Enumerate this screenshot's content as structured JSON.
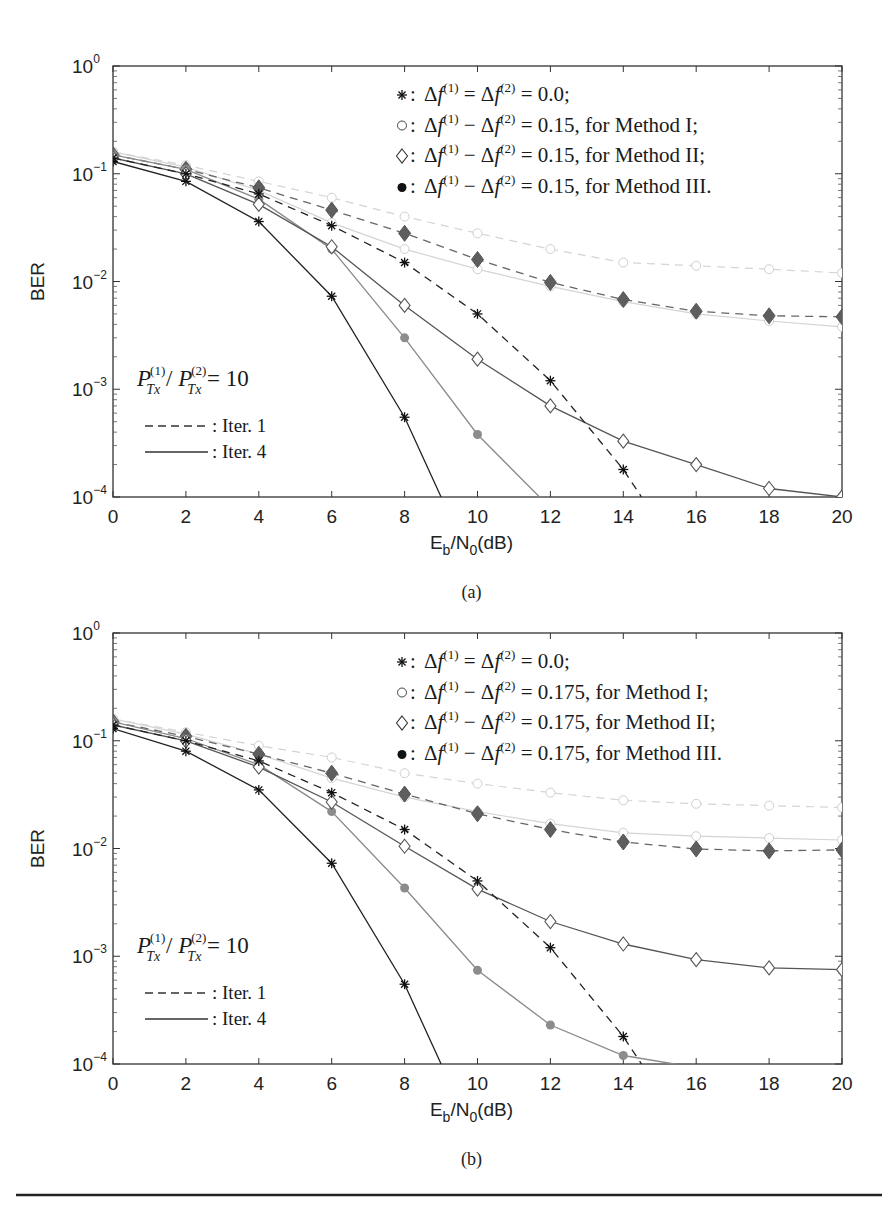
{
  "figure": {
    "rule_color": "#222222",
    "colors": {
      "star": "#222222",
      "diamond": "#555555",
      "filled_iter4": "#8a8a8a",
      "filled_iter1": "#666666",
      "circle": "#d4d4d4"
    }
  },
  "chart_data": [
    {
      "id": "a",
      "type": "line",
      "caption": "(a)",
      "title": "",
      "xlabel": "Eb/N0(dB)",
      "xlabel_parts": {
        "E": "E",
        "sub_b": "b",
        "slash": "/N",
        "sub_0": "0",
        "unit": "(dB)"
      },
      "ylabel": "BER",
      "xscale": "linear",
      "yscale": "log",
      "xlim": [
        0,
        20
      ],
      "ylim": [
        0.0001,
        1
      ],
      "x_ticks": [
        "0",
        "2",
        "4",
        "6",
        "8",
        "10",
        "12",
        "14",
        "16",
        "18",
        "20"
      ],
      "y_ticks": [
        {
          "base": "10",
          "exp": "0"
        },
        {
          "base": "10",
          "exp": "−1"
        },
        {
          "base": "10",
          "exp": "−2"
        },
        {
          "base": "10",
          "exp": "−3"
        },
        {
          "base": "10",
          "exp": "−4"
        }
      ],
      "grid": false,
      "legend": {
        "position": "upper right",
        "entries": [
          {
            "marker": "*",
            "text": "Δf(1) = Δf(2) = 0.0;"
          },
          {
            "marker": "○",
            "text": "Δf(1) − Δf(2) = 0.15, for Method I;"
          },
          {
            "marker": "◇",
            "text": "Δf(1) − Δf(2) = 0.15, for Method II;"
          },
          {
            "marker": "●",
            "text": "Δf(1) − Δf(2) = 0.15, for Method III."
          }
        ]
      },
      "annotation": {
        "text": "P_Tx^(1) / P_Tx^(2) = 10",
        "ratio_value": "10"
      },
      "line_legend": [
        {
          "style": "dashed",
          "text": ": Iter. 1"
        },
        {
          "style": "solid",
          "text": ": Iter. 4"
        }
      ],
      "series": [
        {
          "name": "Δf=0, Iter. 1",
          "marker": "star",
          "style": "dashed",
          "x": [
            0,
            2,
            4,
            6,
            8,
            10,
            12,
            14,
            14.5
          ],
          "values": [
            0.14,
            0.1,
            0.065,
            0.033,
            0.015,
            0.005,
            0.0012,
            0.00018,
            0.0001
          ],
          "marked": 8
        },
        {
          "name": "Δf=0, Iter. 4",
          "marker": "star",
          "style": "solid",
          "x": [
            0,
            2,
            4,
            6,
            8,
            9
          ],
          "values": [
            0.13,
            0.085,
            0.036,
            0.0073,
            0.00055,
            0.0001
          ],
          "marked": 5
        },
        {
          "name": "Method I, Iter. 1",
          "marker": "circle",
          "style": "dashed",
          "x": [
            0,
            2,
            4,
            6,
            8,
            10,
            12,
            14,
            16,
            18,
            20
          ],
          "values": [
            0.16,
            0.12,
            0.085,
            0.06,
            0.04,
            0.028,
            0.02,
            0.015,
            0.014,
            0.013,
            0.012
          ],
          "marked": 11
        },
        {
          "name": "Method I, Iter. 4",
          "marker": "circle",
          "style": "solid",
          "x": [
            0,
            2,
            4,
            6,
            8,
            10,
            12,
            14,
            16,
            18,
            20
          ],
          "values": [
            0.16,
            0.115,
            0.07,
            0.035,
            0.02,
            0.013,
            0.009,
            0.0065,
            0.005,
            0.0043,
            0.0038
          ],
          "marked": 11
        },
        {
          "name": "Method II, Iter. 4",
          "marker": "diamond",
          "style": "solid",
          "x": [
            0,
            2,
            4,
            6,
            8,
            10,
            12,
            14,
            16,
            18,
            20
          ],
          "values": [
            0.14,
            0.1,
            0.052,
            0.021,
            0.006,
            0.0019,
            0.0007,
            0.00033,
            0.0002,
            0.00012,
            0.0001
          ],
          "marked": 11
        },
        {
          "name": "Method III, Iter. 1",
          "marker": "filled-diamond",
          "style": "dashed",
          "x": [
            0,
            2,
            4,
            6,
            8,
            10,
            12,
            14,
            16,
            18,
            20
          ],
          "values": [
            0.15,
            0.11,
            0.074,
            0.046,
            0.028,
            0.016,
            0.0098,
            0.0068,
            0.0053,
            0.0048,
            0.0047
          ],
          "marked": 11
        },
        {
          "name": "Method III, Iter. 4",
          "marker": "filled-circle",
          "style": "solid",
          "x": [
            0,
            2,
            4,
            6,
            8,
            10,
            11.7
          ],
          "values": [
            0.15,
            0.11,
            0.058,
            0.02,
            0.003,
            0.00038,
            0.0001
          ],
          "marked": 6
        }
      ]
    },
    {
      "id": "b",
      "type": "line",
      "caption": "(b)",
      "title": "",
      "xlabel": "Eb/N0(dB)",
      "xlabel_parts": {
        "E": "E",
        "sub_b": "b",
        "slash": "/N",
        "sub_0": "0",
        "unit": "(dB)"
      },
      "ylabel": "BER",
      "xscale": "linear",
      "yscale": "log",
      "xlim": [
        0,
        20
      ],
      "ylim": [
        0.0001,
        1
      ],
      "x_ticks": [
        "0",
        "2",
        "4",
        "6",
        "8",
        "10",
        "12",
        "14",
        "16",
        "18",
        "20"
      ],
      "y_ticks": [
        {
          "base": "10",
          "exp": "0"
        },
        {
          "base": "10",
          "exp": "−1"
        },
        {
          "base": "10",
          "exp": "−2"
        },
        {
          "base": "10",
          "exp": "−3"
        },
        {
          "base": "10",
          "exp": "−4"
        }
      ],
      "grid": false,
      "legend": {
        "position": "upper right",
        "entries": [
          {
            "marker": "*",
            "text": "Δf(1) = Δf(2) = 0.0;"
          },
          {
            "marker": "○",
            "text": "Δf(1) − Δf(2) = 0.175, for Method I;"
          },
          {
            "marker": "◇",
            "text": "Δf(1) − Δf(2) = 0.175, for Method II;"
          },
          {
            "marker": "●",
            "text": "Δf(1) − Δf(2) = 0.175, for Method III."
          }
        ]
      },
      "annotation": {
        "text": "P_Tx^(1) / P_Tx^(2) = 10",
        "ratio_value": "10"
      },
      "line_legend": [
        {
          "style": "dashed",
          "text": ": Iter. 1"
        },
        {
          "style": "solid",
          "text": ": Iter. 4"
        }
      ],
      "series": [
        {
          "name": "Δf=0, Iter. 1",
          "marker": "star",
          "style": "dashed",
          "x": [
            0,
            2,
            4,
            6,
            8,
            10,
            12,
            14,
            14.5
          ],
          "values": [
            0.14,
            0.1,
            0.065,
            0.033,
            0.015,
            0.005,
            0.0012,
            0.00018,
            0.0001
          ],
          "marked": 8
        },
        {
          "name": "Δf=0, Iter. 4",
          "marker": "star",
          "style": "solid",
          "x": [
            0,
            2,
            4,
            6,
            8,
            9
          ],
          "values": [
            0.13,
            0.08,
            0.035,
            0.0073,
            0.00055,
            0.0001
          ],
          "marked": 5
        },
        {
          "name": "Method I, Iter. 1",
          "marker": "circle",
          "style": "dashed",
          "x": [
            0,
            2,
            4,
            6,
            8,
            10,
            12,
            14,
            16,
            18,
            20
          ],
          "values": [
            0.16,
            0.12,
            0.09,
            0.07,
            0.05,
            0.04,
            0.033,
            0.028,
            0.026,
            0.025,
            0.024
          ],
          "marked": 11
        },
        {
          "name": "Method I, Iter. 4",
          "marker": "circle",
          "style": "solid",
          "x": [
            0,
            2,
            4,
            6,
            8,
            10,
            12,
            14,
            16,
            18,
            20
          ],
          "values": [
            0.16,
            0.115,
            0.075,
            0.045,
            0.03,
            0.022,
            0.017,
            0.014,
            0.013,
            0.0125,
            0.012
          ],
          "marked": 11
        },
        {
          "name": "Method II, Iter. 4",
          "marker": "diamond",
          "style": "solid",
          "x": [
            0,
            2,
            4,
            6,
            8,
            10,
            12,
            14,
            16,
            18,
            20
          ],
          "values": [
            0.14,
            0.1,
            0.057,
            0.027,
            0.0105,
            0.0042,
            0.0021,
            0.0013,
            0.00093,
            0.00078,
            0.00075
          ],
          "marked": 11
        },
        {
          "name": "Method III, Iter. 1",
          "marker": "filled-diamond",
          "style": "dashed",
          "x": [
            0,
            2,
            4,
            6,
            8,
            10,
            12,
            14,
            16,
            18,
            20
          ],
          "values": [
            0.15,
            0.11,
            0.075,
            0.05,
            0.032,
            0.021,
            0.015,
            0.0115,
            0.0099,
            0.0095,
            0.0097
          ],
          "marked": 11
        },
        {
          "name": "Method III, Iter. 4",
          "marker": "filled-circle",
          "style": "solid",
          "x": [
            0,
            2,
            4,
            6,
            8,
            10,
            12,
            14,
            15.4
          ],
          "values": [
            0.15,
            0.105,
            0.06,
            0.022,
            0.0043,
            0.00074,
            0.00023,
            0.00012,
            0.0001
          ],
          "marked": 8
        }
      ]
    }
  ]
}
